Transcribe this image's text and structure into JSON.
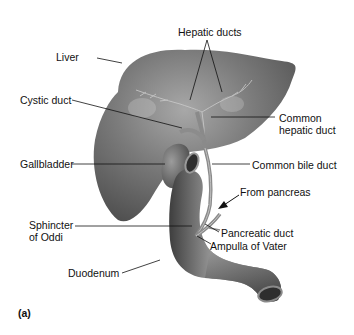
{
  "figure": {
    "panel_label": "(a)",
    "colors": {
      "organ_dark": "#4a4a4a",
      "organ_mid": "#7a7a7a",
      "organ_light": "#b5b5b5",
      "leader_line": "#111111",
      "background": "#ffffff"
    },
    "labels": {
      "liver": "Liver",
      "hepatic_ducts": "Hepatic ducts",
      "cystic_duct": "Cystic duct",
      "common_hepatic_duct_line1": "Common",
      "common_hepatic_duct_line2": "hepatic duct",
      "gallbladder": "Gallbladder",
      "common_bile_duct": "Common bile duct",
      "from_pancreas": "From pancreas",
      "sphincter_line1": "Sphincter",
      "sphincter_line2": "of Oddi",
      "pancreatic_duct": "Pancreatic duct",
      "ampulla": "Ampulla of Vater",
      "duodenum": "Duodenum"
    }
  }
}
